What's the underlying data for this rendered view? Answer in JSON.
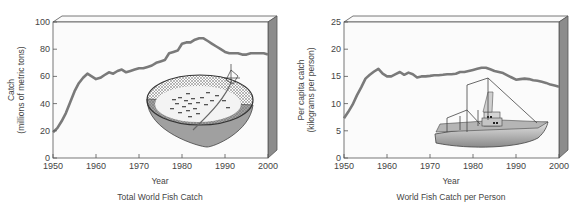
{
  "chart_data": [
    {
      "type": "line",
      "title": "Total World Fish Catch",
      "xlabel": "Year",
      "ylabel": "Catch\n(millions of metric tons)",
      "ylabel_line1": "Catch",
      "ylabel_line2": "(millions of metric tons)",
      "xlim": [
        1950,
        2000
      ],
      "ylim": [
        0,
        100
      ],
      "xticks": [
        1950,
        1960,
        1970,
        1980,
        1990,
        2000
      ],
      "yticks": [
        0,
        20,
        40,
        60,
        80,
        100
      ],
      "grid": false,
      "illustration": "circular purse-seine net with fish",
      "x": [
        1950,
        1951,
        1952,
        1953,
        1954,
        1955,
        1956,
        1957,
        1958,
        1959,
        1960,
        1961,
        1962,
        1963,
        1964,
        1965,
        1966,
        1967,
        1968,
        1969,
        1970,
        1971,
        1972,
        1973,
        1974,
        1975,
        1976,
        1977,
        1978,
        1979,
        1980,
        1981,
        1982,
        1983,
        1984,
        1985,
        1986,
        1987,
        1988,
        1989,
        1990,
        1991,
        1992,
        1993,
        1994,
        1995,
        1996,
        1997,
        1998,
        1999,
        2000
      ],
      "values": [
        19,
        22,
        27,
        33,
        41,
        49,
        55,
        59,
        62,
        60,
        58,
        59,
        61,
        63,
        62,
        64,
        65,
        63,
        64,
        65,
        66,
        66,
        67,
        68,
        70,
        71,
        72,
        77,
        78,
        79,
        84,
        85,
        85,
        87,
        88,
        88,
        86,
        84,
        82,
        80,
        78,
        77,
        77,
        77,
        76,
        76,
        77,
        77,
        77,
        77,
        76
      ]
    },
    {
      "type": "line",
      "title": "World Fish Catch per Person",
      "xlabel": "Year",
      "ylabel": "Per capita catch\n(kilograms per person)",
      "ylabel_line1": "Per capita catch",
      "ylabel_line2": "(kilograms per person)",
      "xlim": [
        1950,
        2000
      ],
      "ylim": [
        0,
        25
      ],
      "xticks": [
        1950,
        1960,
        1970,
        1980,
        1990,
        2000
      ],
      "yticks": [
        0,
        5,
        10,
        15,
        20,
        25
      ],
      "grid": false,
      "illustration": "fishing trawler boat",
      "x": [
        1950,
        1951,
        1952,
        1953,
        1954,
        1955,
        1956,
        1957,
        1958,
        1959,
        1960,
        1961,
        1962,
        1963,
        1964,
        1965,
        1966,
        1967,
        1968,
        1969,
        1970,
        1971,
        1972,
        1973,
        1974,
        1975,
        1976,
        1977,
        1978,
        1979,
        1980,
        1981,
        1982,
        1983,
        1984,
        1985,
        1986,
        1987,
        1988,
        1989,
        1990,
        1991,
        1992,
        1993,
        1994,
        1995,
        1996,
        1997,
        1998,
        1999,
        2000
      ],
      "values": [
        7.3,
        8.5,
        9.8,
        11.5,
        13,
        14.6,
        15.3,
        15.9,
        16.4,
        15.5,
        15,
        15,
        15.4,
        15.8,
        15.3,
        15.7,
        15.4,
        14.8,
        15,
        15,
        15.1,
        15.2,
        15.2,
        15.3,
        15.4,
        15.4,
        15.5,
        15.8,
        15.8,
        16,
        16.2,
        16.4,
        16.6,
        16.6,
        16.3,
        16,
        15.8,
        15.6,
        15.2,
        14.8,
        14.4,
        14.5,
        14.6,
        14.5,
        14.3,
        14.2,
        14,
        13.8,
        13.5,
        13.3,
        13.1
      ]
    }
  ],
  "style": {
    "line_color": "#7a7a7a",
    "frame_color": "#555555",
    "side_panel_color": "#8c8c8c",
    "plot_bg": "#fbfbfb"
  }
}
